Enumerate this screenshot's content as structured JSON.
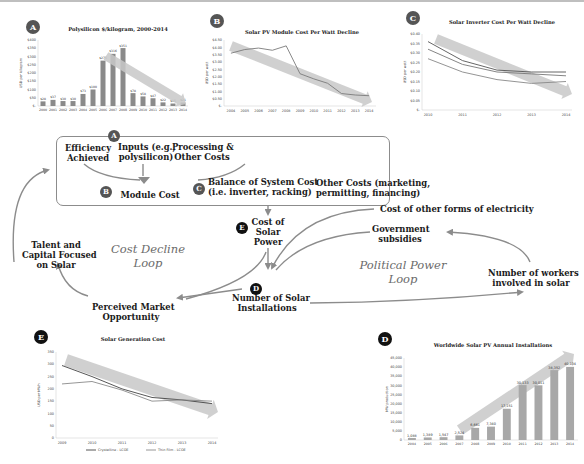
{
  "diagram": {
    "loops": {
      "cost_decline": [
        "Cost Decline",
        "Loop"
      ],
      "political_power": [
        "Political Power",
        "Loop"
      ]
    },
    "box": {
      "badge_a": "A",
      "efficiency": [
        "Efficiency",
        "Achieved"
      ],
      "inputs": [
        "Inputs (e.g.,",
        "polysilicon)"
      ],
      "processing": [
        "Processing &",
        "Other Costs"
      ],
      "badge_b": "B",
      "module_cost": "Module Cost",
      "badge_c": "C",
      "bos": [
        "Balance of System Cost",
        "(i.e. inverter, racking)"
      ],
      "other_costs": [
        "Other Costs (marketing,",
        "permitting, financing)"
      ]
    },
    "nodes": {
      "badge_e": "E",
      "cost_solar_power": [
        "Cost of",
        "Solar",
        "Power"
      ],
      "badge_d": "D",
      "num_installations": [
        "Number of Solar",
        "Installations"
      ],
      "talent": [
        "Talent and",
        "Capital Focused",
        "on Solar"
      ],
      "market": [
        "Perceived Market",
        "Opportunity"
      ],
      "other_electricity": "Cost of other forms of electricity",
      "subsidies": [
        "Government",
        "subsidies"
      ],
      "workers": [
        "Number of workers",
        "involved in solar"
      ]
    },
    "colors": {
      "arrow": "#8c8c8c",
      "bar": "#8a8a8a",
      "trend": "#c8c8c8",
      "line_dark": "#555555",
      "line_light": "#8a8a8a"
    }
  },
  "chart_data": [
    {
      "id": "A",
      "type": "bar",
      "title": "Polysilicon $/kilogram, 2000-2014",
      "ylabel": "USD per kilogram",
      "ylim": [
        0,
        400
      ],
      "yticks": [
        "$-",
        "$50",
        "$100",
        "$150",
        "$200",
        "$250",
        "$300",
        "$350",
        "$400"
      ],
      "categories": [
        "2000",
        "2001",
        "2002",
        "2003",
        "2004",
        "2005",
        "2006",
        "2007",
        "2008",
        "2009",
        "2010",
        "2011",
        "2012",
        "2013",
        "2014"
      ],
      "values": [
        28,
        37,
        30,
        30,
        73,
        100,
        275,
        316,
        351,
        78,
        58,
        47,
        22,
        15,
        21
      ],
      "labels": [
        "$28",
        "$37",
        "$30",
        "$30",
        "$73",
        "$100",
        "$275",
        "$316",
        "$351",
        "$78",
        "$58",
        "$47",
        "$22",
        "$15",
        "$21"
      ],
      "trend_arrow": "downward from 2006 to 2014"
    },
    {
      "id": "B",
      "type": "line",
      "title": "Solar PV Module Cost Per Watt Decline",
      "ylabel": "USD per watt",
      "ylim": [
        0,
        4.5
      ],
      "yticks": [
        "$-",
        "$0.50",
        "$1.00",
        "$1.50",
        "$2.00",
        "$2.50",
        "$3.00",
        "$3.50",
        "$4.00",
        "$4.50"
      ],
      "x": [
        "2004",
        "2005",
        "2006",
        "2007",
        "2008",
        "2009",
        "2010",
        "2011",
        "2012",
        "2013",
        "2014"
      ],
      "series": [
        {
          "name": "Module cost",
          "values": [
            3.6,
            3.85,
            3.95,
            3.8,
            4.1,
            2.2,
            1.85,
            1.55,
            0.85,
            0.75,
            0.7
          ]
        }
      ],
      "trend_arrow": "downward 2004 to 2014"
    },
    {
      "id": "C",
      "type": "line",
      "title": "Solar Inverter Cost Per Watt Decline",
      "ylabel": "USD per watt",
      "ylim": [
        0,
        0.4
      ],
      "yticks": [
        "$-",
        "$0.05",
        "$0.10",
        "$0.15",
        "$0.20",
        "$0.25",
        "$0.30",
        "$0.35",
        "$0.40"
      ],
      "x": [
        "2010",
        "2011",
        "2012",
        "2013",
        "2014"
      ],
      "series": [
        {
          "name": "Series 1",
          "values": [
            0.36,
            0.26,
            0.21,
            0.2,
            0.2
          ]
        },
        {
          "name": "Series 2",
          "values": [
            0.32,
            0.24,
            0.2,
            0.19,
            0.18
          ]
        },
        {
          "name": "Series 3",
          "values": [
            0.27,
            0.2,
            0.16,
            0.14,
            0.15
          ]
        }
      ],
      "trend_arrow": "downward 2010 to 2014"
    },
    {
      "id": "E",
      "type": "line",
      "title": "Solar Generation Cost",
      "ylabel": "USD per MWh",
      "ylim": [
        0,
        350
      ],
      "yticks": [
        "0",
        "50",
        "100",
        "150",
        "200",
        "250",
        "300",
        "350"
      ],
      "x": [
        "2009",
        "2010",
        "2011",
        "2012",
        "2013",
        "2014"
      ],
      "series": [
        {
          "name": "Crystalline - LCOE",
          "values": [
            295,
            250,
            200,
            165,
            155,
            140
          ]
        },
        {
          "name": "Thin Film - LCOE",
          "values": [
            220,
            230,
            195,
            150,
            155,
            150
          ]
        }
      ],
      "legend": [
        "Crystalline - LCOE",
        "Thin Film - LCOE"
      ],
      "legend_position": "bottom",
      "trend_arrow": "downward 2009 to 2014"
    },
    {
      "id": "D",
      "type": "bar",
      "title": "Worldwide Solar PV Annual Installations",
      "ylabel": "MW production",
      "ylim": [
        0,
        45000
      ],
      "yticks": [
        "0",
        "5,000",
        "10,000",
        "15,000",
        "20,000",
        "25,000",
        "30,000",
        "35,000",
        "40,000",
        "45,000"
      ],
      "categories": [
        "2004",
        "2005",
        "2006",
        "2007",
        "2008",
        "2009",
        "2010",
        "2011",
        "2012",
        "2013",
        "2014"
      ],
      "values": [
        1088,
        1389,
        1547,
        2524,
        6661,
        7340,
        17151,
        30133,
        30011,
        38352,
        40134
      ],
      "labels": [
        "1,088",
        "1,389",
        "1,547",
        "2,524",
        "6,661",
        "7,340",
        "17,151",
        "30,133",
        "30,011",
        "38,352",
        "40,134"
      ],
      "trend_arrow": "upward 2007 to 2014"
    }
  ]
}
